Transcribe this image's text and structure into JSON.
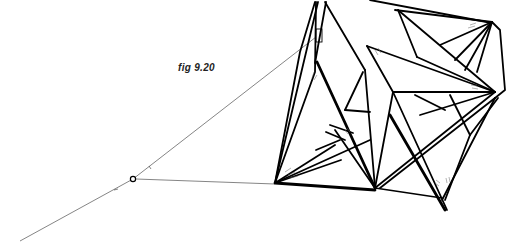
{
  "figure": {
    "caption": "fig 9.20"
  }
}
